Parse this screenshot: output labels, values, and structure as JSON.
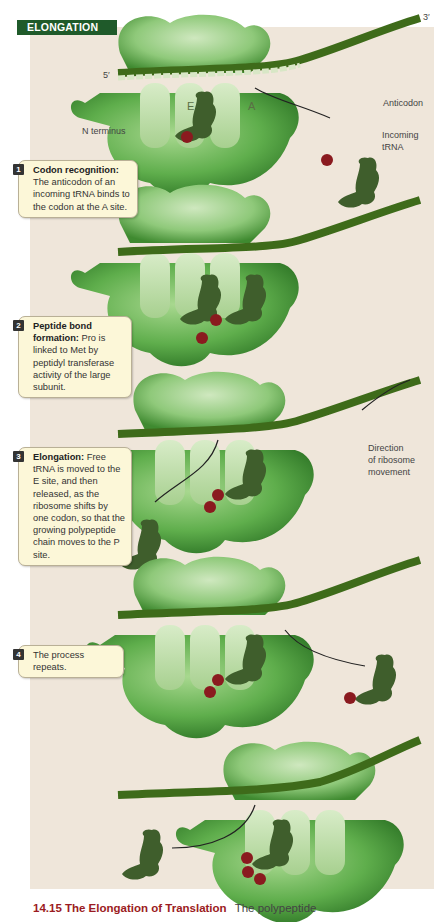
{
  "figure": {
    "title_tag": "ELONGATION",
    "page_number_fragment": "...",
    "caption": {
      "figure_label": "14.15 The Elongation of Translation",
      "text": "The polypeptide"
    }
  },
  "labels": {
    "five_prime": "5′",
    "three_prime": "3′",
    "e_site": "E",
    "a_site": "A",
    "anticodon": "Anticodon",
    "incoming_trna_line1": "Incoming",
    "incoming_trna_line2": "tRNA",
    "n_terminus": "N terminus",
    "direction_line1": "Direction",
    "direction_line2": "of ribosome",
    "direction_line3": "movement"
  },
  "mrna_sequence": "CCGUUAAUGCCGUAUGCUCUUUAA",
  "steps": [
    {
      "num": "1",
      "title": "Codon recognition:",
      "text": "The anticodon of an incoming tRNA binds to the codon at the A site."
    },
    {
      "num": "2",
      "title": "Peptide bond formation:",
      "text": "Pro is linked to Met by peptidyl transferase activity of the large subunit."
    },
    {
      "num": "3",
      "title": "Elongation:",
      "text": "Free tRNA is moved to the E site, and then released, as the ribosome shifts by one codon, so that the growing polypeptide chain moves to the P site."
    },
    {
      "num": "4",
      "title": "",
      "text": "The process repeats."
    }
  ],
  "stages": [
    {
      "ribosome_anticodons": "UAC",
      "incoming_anticodon": "GGC",
      "amino_acids": [
        "Met"
      ],
      "incoming_amino_acid": "Pro"
    },
    {
      "ribosome_anticodons": "UACGGC",
      "amino_acids": [
        "Met",
        "Pro"
      ]
    },
    {
      "ribosome_anticodons": "GGC",
      "released_anticodon": "UAC",
      "amino_acids": [
        "Pro",
        "Met"
      ]
    },
    {
      "ribosome_anticodons": "GGC",
      "incoming_anticodon": "AUA",
      "amino_acids": [
        "Pro",
        "Met"
      ],
      "incoming_amino_acid": "Tyr"
    },
    {
      "ribosome_anticodons": "AUA",
      "released_anticodon": "GGC",
      "amino_acids": [
        "Tyr",
        "Pro",
        "Met"
      ]
    }
  ],
  "colors": {
    "panel_bg": "#efe6da",
    "title_tag_bg": "#1f5a2a",
    "ribosome_green": "#5fae4c",
    "mrna_green": "#3e6b1a",
    "amino_acid_red": "#8a1a1f",
    "callout_bg": "#fcf7d8",
    "caption_red": "#9b1b22"
  }
}
